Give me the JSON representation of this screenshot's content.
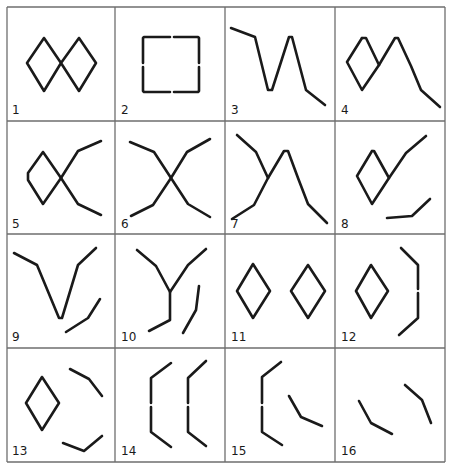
{
  "figure": {
    "rows": 4,
    "cols": 4,
    "grid": {
      "x": [
        7,
        115,
        225,
        335,
        445
      ],
      "y": [
        7,
        121,
        234,
        348,
        462
      ],
      "color": "#6e6e6e"
    },
    "stroke_color": "#1a1a1a",
    "cells": [
      {
        "label": "1",
        "label_pos": [
          12,
          114
        ],
        "description": "two joined diamonds (figure-eight)",
        "paths": [
          [
            [
              44,
              38
            ],
            [
              27,
              63
            ],
            [
              44,
              91
            ],
            [
              61,
              63
            ],
            [
              44,
              38
            ]
          ],
          [
            [
              79,
              38
            ],
            [
              61,
              63
            ],
            [
              79,
              91
            ],
            [
              96,
              63
            ],
            [
              79,
              38
            ]
          ]
        ]
      },
      {
        "label": "2",
        "label_pos": [
          121,
          114
        ],
        "description": "square with gaps at side midpoints",
        "paths": [
          [
            [
              170,
              37
            ],
            [
              144,
              37
            ],
            [
              143,
              38
            ],
            [
              143,
              63
            ]
          ],
          [
            [
              143,
              67
            ],
            [
              143,
              91
            ],
            [
              144,
              92
            ],
            [
              170,
              92
            ]
          ],
          [
            [
              174,
              92
            ],
            [
              198,
              92
            ],
            [
              199,
              91
            ],
            [
              199,
              67
            ]
          ],
          [
            [
              199,
              63
            ],
            [
              199,
              38
            ],
            [
              198,
              37
            ],
            [
              174,
              37
            ]
          ]
        ]
      },
      {
        "label": "3",
        "label_pos": [
          231,
          114
        ],
        "description": "zigzag line with peak",
        "paths": [
          [
            [
              231,
              28
            ],
            [
              255,
              37
            ],
            [
              268,
              90
            ],
            [
              272,
              90
            ],
            [
              289,
              37
            ],
            [
              292,
              37
            ],
            [
              306,
              90
            ],
            [
              325,
              105
            ]
          ]
        ]
      },
      {
        "label": "4",
        "label_pos": [
          341,
          114
        ],
        "description": "diamond merged into peak and tail",
        "paths": [
          [
            [
              362,
              38
            ],
            [
              347,
              62
            ],
            [
              362,
              90
            ],
            [
              379,
              65
            ],
            [
              395,
              38
            ],
            [
              398,
              38
            ],
            [
              411,
              66
            ],
            [
              421,
              90
            ],
            [
              440,
              107
            ]
          ],
          [
            [
              379,
              65
            ],
            [
              366,
              38
            ],
            [
              362,
              38
            ]
          ]
        ]
      },
      {
        "label": "5",
        "label_pos": [
          12,
          228
        ],
        "description": "diamond with two diverging arms",
        "paths": [
          [
            [
              43,
              152
            ],
            [
              28,
              173
            ],
            [
              28,
              180
            ],
            [
              43,
              204
            ],
            [
              61,
              178
            ],
            [
              43,
              152
            ]
          ],
          [
            [
              61,
              178
            ],
            [
              78,
              151
            ],
            [
              101,
              141
            ]
          ],
          [
            [
              61,
              178
            ],
            [
              78,
              204
            ],
            [
              101,
              215
            ]
          ]
        ]
      },
      {
        "label": "6",
        "label_pos": [
          121,
          228
        ],
        "description": "X cross with bent arms",
        "paths": [
          [
            [
              130,
              142
            ],
            [
              154,
              152
            ],
            [
              171,
              178
            ],
            [
              187,
              152
            ],
            [
              210,
              139
            ]
          ],
          [
            [
              131,
              216
            ],
            [
              153,
              205
            ],
            [
              171,
              178
            ],
            [
              188,
              204
            ],
            [
              210,
              217
            ]
          ]
        ]
      },
      {
        "label": "7",
        "label_pos": [
          231,
          228
        ],
        "description": "cross with peak on right",
        "paths": [
          [
            [
              237,
              135
            ],
            [
              256,
              152
            ],
            [
              268,
              178
            ]
          ],
          [
            [
              232,
              219
            ],
            [
              254,
              205
            ],
            [
              268,
              178
            ],
            [
              284,
              151
            ],
            [
              288,
              151
            ],
            [
              298,
              178
            ],
            [
              308,
              204
            ],
            [
              327,
              223
            ]
          ]
        ]
      },
      {
        "label": "8",
        "label_pos": [
          341,
          228
        ],
        "description": "diamond with arm and separate bent stroke",
        "paths": [
          [
            [
              372,
              151
            ],
            [
              357,
              176
            ],
            [
              372,
              204
            ],
            [
              389,
              178
            ],
            [
              374,
              151
            ],
            [
              372,
              151
            ]
          ],
          [
            [
              389,
              178
            ],
            [
              406,
              153
            ],
            [
              426,
              136
            ]
          ],
          [
            [
              387,
              218
            ],
            [
              412,
              216
            ],
            [
              430,
              199
            ]
          ]
        ]
      },
      {
        "label": "9",
        "label_pos": [
          12,
          341
        ],
        "description": "V shape with separate bent stroke",
        "paths": [
          [
            [
              14,
              253
            ],
            [
              37,
              265
            ],
            [
              59,
              318
            ],
            [
              62,
              318
            ],
            [
              78,
              265
            ],
            [
              96,
              248
            ]
          ],
          [
            [
              66,
              332
            ],
            [
              88,
              318
            ],
            [
              100,
              299
            ]
          ]
        ]
      },
      {
        "label": "10",
        "label_pos": [
          121,
          341
        ],
        "description": "Y shape with separate bent stroke",
        "paths": [
          [
            [
              137,
              250
            ],
            [
              156,
              266
            ],
            [
              170,
              292
            ],
            [
              188,
              265
            ],
            [
              206,
              249
            ]
          ],
          [
            [
              170,
              292
            ],
            [
              170,
              320
            ],
            [
              149,
              331
            ]
          ],
          [
            [
              199,
              286
            ],
            [
              196,
              310
            ],
            [
              183,
              333
            ]
          ]
        ]
      },
      {
        "label": "11",
        "label_pos": [
          231,
          341
        ],
        "description": "two separate diamonds",
        "paths": [
          [
            [
              253,
              264
            ],
            [
              237,
              291
            ],
            [
              253,
              318
            ],
            [
              270,
              291
            ],
            [
              253,
              264
            ]
          ],
          [
            [
              308,
              265
            ],
            [
              291,
              291
            ],
            [
              308,
              318
            ],
            [
              325,
              291
            ],
            [
              308,
              265
            ]
          ]
        ]
      },
      {
        "label": "12",
        "label_pos": [
          341,
          341
        ],
        "description": "diamond with separate bracket",
        "paths": [
          [
            [
              371,
              265
            ],
            [
              356,
              291
            ],
            [
              371,
              318
            ],
            [
              388,
              291
            ],
            [
              371,
              265
            ]
          ],
          [
            [
              401,
              248
            ],
            [
              418,
              265
            ],
            [
              418,
              289
            ]
          ],
          [
            [
              418,
              293
            ],
            [
              418,
              318
            ],
            [
              399,
              335
            ]
          ]
        ]
      },
      {
        "label": "13",
        "label_pos": [
          12,
          455
        ],
        "description": "diamond with two separate bent strokes",
        "paths": [
          [
            [
              42,
              377
            ],
            [
              26,
              403
            ],
            [
              42,
              430
            ],
            [
              59,
              403
            ],
            [
              42,
              377
            ]
          ],
          [
            [
              70,
              369
            ],
            [
              89,
              379
            ],
            [
              102,
              396
            ]
          ],
          [
            [
              63,
              443
            ],
            [
              84,
              451
            ],
            [
              102,
              436
            ]
          ]
        ]
      },
      {
        "label": "14",
        "label_pos": [
          121,
          455
        ],
        "description": "two bracket shapes",
        "paths": [
          [
            [
              171,
              363
            ],
            [
              151,
              378
            ],
            [
              151,
              403
            ]
          ],
          [
            [
              151,
              407
            ],
            [
              151,
              432
            ],
            [
              171,
              447
            ]
          ],
          [
            [
              206,
              361
            ],
            [
              188,
              378
            ],
            [
              188,
              403
            ]
          ],
          [
            [
              188,
              407
            ],
            [
              188,
              432
            ],
            [
              206,
              446
            ]
          ]
        ]
      },
      {
        "label": "15",
        "label_pos": [
          231,
          455
        ],
        "description": "bracket with separate bent stroke",
        "paths": [
          [
            [
              281,
              362
            ],
            [
              262,
              377
            ],
            [
              262,
              403
            ]
          ],
          [
            [
              262,
              407
            ],
            [
              262,
              432
            ],
            [
              282,
              445
            ]
          ],
          [
            [
              289,
              396
            ],
            [
              301,
              417
            ],
            [
              322,
              426
            ]
          ]
        ]
      },
      {
        "label": "16",
        "label_pos": [
          341,
          455
        ],
        "description": "two separate bent strokes",
        "paths": [
          [
            [
              359,
              401
            ],
            [
              371,
              423
            ],
            [
              392,
              434
            ]
          ],
          [
            [
              405,
              385
            ],
            [
              422,
              400
            ],
            [
              431,
              423
            ]
          ]
        ]
      }
    ]
  }
}
